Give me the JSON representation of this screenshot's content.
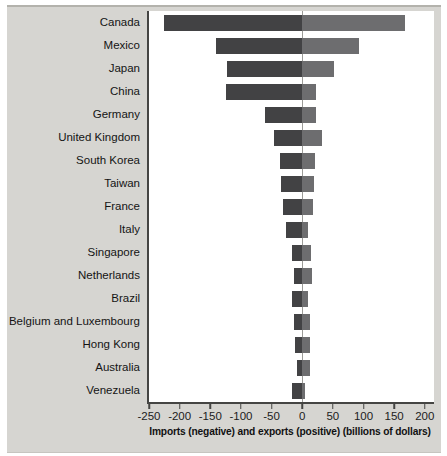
{
  "style": {
    "panel_bg": "#d6d5d1",
    "plot_bg": "#ffffff",
    "axis_color": "#454543",
    "zero_line_color": "#9b9b97",
    "imports_bar_color": "#424244",
    "exports_bar_color": "#6d6d6f",
    "text_color": "#141414"
  },
  "chart_data": {
    "type": "bar",
    "orientation": "horizontal-diverging",
    "title": "",
    "xlabel": "Imports (negative) and exports (positive) (billions of dollars)",
    "ylabel": "",
    "units": "billions of dollars",
    "grid": "zero-line-only",
    "legend": "none",
    "categories": [
      "Canada",
      "Mexico",
      "Japan",
      "China",
      "Germany",
      "United Kingdom",
      "South Korea",
      "Taiwan",
      "France",
      "Italy",
      "Singapore",
      "Netherlands",
      "Brazil",
      "Belgium and Luxembourg",
      "Hong Kong",
      "Australia",
      "Venezuela"
    ],
    "series": [
      {
        "name": "Imports (negative)",
        "color": "#424244",
        "values": [
          -225,
          -140,
          -122,
          -124,
          -61,
          -46,
          -36,
          -34,
          -31,
          -26,
          -16,
          -13,
          -17,
          -14,
          -12,
          -9,
          -17
        ]
      },
      {
        "name": "Exports (positive)",
        "color": "#6d6d6f",
        "values": [
          168,
          93,
          52,
          22,
          22,
          33,
          21,
          19,
          18,
          10,
          14,
          16,
          10,
          13,
          13,
          13,
          4
        ]
      }
    ],
    "xlim": [
      -250,
      215
    ],
    "xticks": [
      -250,
      -200,
      -150,
      -100,
      -50,
      0,
      50,
      100,
      150,
      200
    ],
    "xtick_labels": [
      "-250",
      "-200",
      "-150",
      "-100",
      "-50",
      "0",
      "50",
      "100",
      "150",
      "200"
    ]
  }
}
